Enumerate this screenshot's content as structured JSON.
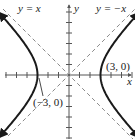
{
  "chart_data": {
    "type": "line",
    "title": "",
    "xlabel": "x",
    "ylabel": "y",
    "xlim": [
      -6.5,
      6.3
    ],
    "ylim": [
      -6.2,
      7.1
    ],
    "grid": false,
    "equation": "x^2/9 - y^2/9 = 1",
    "series": [
      {
        "name": "hyperbola right branch",
        "style": "solid-bold",
        "x": [
          6.3,
          5,
          4,
          3.5,
          3,
          3.5,
          4,
          5,
          6.3
        ],
        "y": [
          5.54,
          4,
          2.65,
          1.8,
          0,
          -1.8,
          -2.65,
          -4,
          -5.54
        ]
      },
      {
        "name": "hyperbola left branch",
        "style": "solid-bold",
        "x": [
          -6.3,
          -5,
          -4,
          -3.5,
          -3,
          -3.5,
          -4,
          -5,
          -6.3
        ],
        "y": [
          5.54,
          4,
          2.65,
          1.8,
          0,
          -1.8,
          -2.65,
          -4,
          -5.54
        ]
      },
      {
        "name": "y = x",
        "style": "dashed",
        "x": [
          -6.5,
          6.3
        ],
        "y": [
          -6.5,
          6.3
        ]
      },
      {
        "name": "y = -x",
        "style": "dashed",
        "x": [
          -6.5,
          6.3
        ],
        "y": [
          6.5,
          -6.3
        ]
      }
    ],
    "annotations": [
      {
        "text": "y = x",
        "near": "upper-left asymptote"
      },
      {
        "text": "y = −x",
        "near": "upper-right asymptote"
      },
      {
        "text": "(3, 0)",
        "point": [
          3,
          0
        ]
      },
      {
        "text": "(−3, 0)",
        "point": [
          -3,
          0
        ]
      }
    ],
    "tick_spacing": 1
  },
  "labels": {
    "y_eq_x": "y = x",
    "y_eq_neg_x": "y = −x",
    "vertex_right": "(3, 0)",
    "vertex_left": "(−3, 0)",
    "x_axis": "x",
    "y_axis": "y"
  },
  "colors": {
    "curve": "#1a1a1a",
    "asymptote": "#8a8a8a",
    "axis": "#555555"
  }
}
